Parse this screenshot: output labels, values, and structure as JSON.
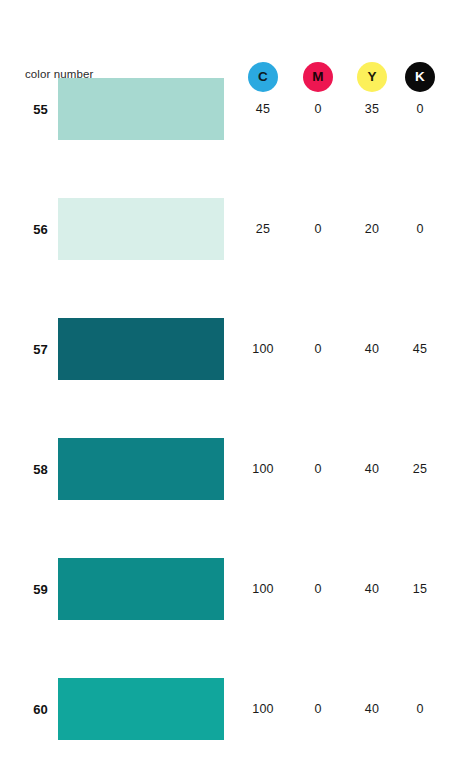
{
  "page": {
    "background": "#ffffff"
  },
  "header": {
    "label": "color number",
    "inks": [
      {
        "letter": "C",
        "name": "cyan",
        "circle_color": "#2BA9E0",
        "text_color": "#0d1a22",
        "x": 248
      },
      {
        "letter": "M",
        "name": "magenta",
        "circle_color": "#ED1651",
        "text_color": "#1a0309",
        "x": 303
      },
      {
        "letter": "Y",
        "name": "yellow",
        "circle_color": "#FCF05A",
        "text_color": "#1a1a08",
        "x": 357
      },
      {
        "letter": "K",
        "name": "black",
        "circle_color": "#0A0A0A",
        "text_color": "#ffffff",
        "x": 405
      }
    ],
    "value_columns_x": [
      241,
      296,
      350,
      398
    ]
  },
  "chart_data": {
    "type": "table",
    "title": "color number",
    "columns": [
      "color number",
      "swatch",
      "C",
      "M",
      "Y",
      "K"
    ],
    "rows": [
      {
        "number": "55",
        "swatch_hex": "#A7D9D0",
        "c": "45",
        "m": "0",
        "y": "35",
        "k": "0",
        "top": 78
      },
      {
        "number": "56",
        "swatch_hex": "#D8EFE9",
        "c": "25",
        "m": "0",
        "y": "20",
        "k": "0",
        "top": 198
      },
      {
        "number": "57",
        "swatch_hex": "#0D6570",
        "c": "100",
        "m": "0",
        "y": "40",
        "k": "45",
        "top": 318
      },
      {
        "number": "58",
        "swatch_hex": "#0E8185",
        "c": "100",
        "m": "0",
        "y": "40",
        "k": "25",
        "top": 438
      },
      {
        "number": "59",
        "swatch_hex": "#0D8C8A",
        "c": "100",
        "m": "0",
        "y": "40",
        "k": "15",
        "top": 558
      },
      {
        "number": "60",
        "swatch_hex": "#11A69C",
        "c": "100",
        "m": "0",
        "y": "40",
        "k": "0",
        "top": 678
      }
    ]
  }
}
